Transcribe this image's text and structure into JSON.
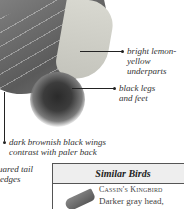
{
  "annotations": [
    {
      "id": "underparts",
      "text_line1": "bright lemon-",
      "text_line2": "yellow underparts"
    },
    {
      "id": "legs",
      "text_line1": "black legs",
      "text_line2": "and feet"
    },
    {
      "id": "wings",
      "text_line1": "dark brownish black wings",
      "text_line2": "contrast with paler back"
    },
    {
      "id": "tail",
      "text_line1": "squared tail",
      "text_line2": "edges"
    }
  ],
  "similar_birds": {
    "title": "Similar Birds",
    "items": [
      {
        "name": "Cassin's Kingbird",
        "description": "Darker gray head,"
      }
    ]
  }
}
